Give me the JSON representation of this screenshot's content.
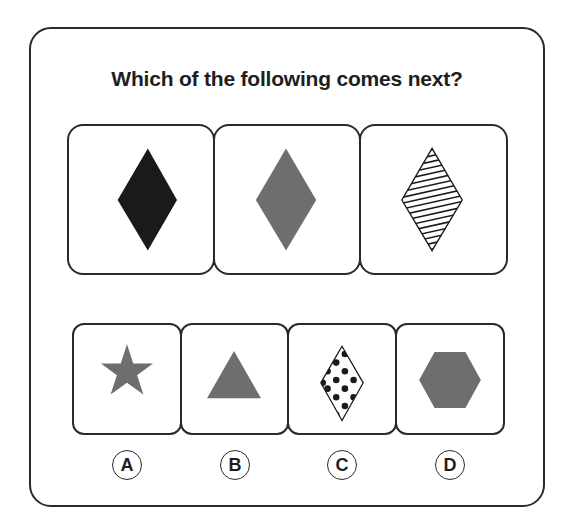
{
  "question": {
    "title": "Which of the following comes next?"
  },
  "sequence": [
    {
      "shape": "diamond",
      "fill": "solid",
      "color": "#1a1a1a"
    },
    {
      "shape": "diamond",
      "fill": "solid",
      "color": "#6e6e6e"
    },
    {
      "shape": "diamond",
      "fill": "hatched",
      "color": "#1a1a1a"
    }
  ],
  "options": [
    {
      "label": "A",
      "shape": "star",
      "fill": "solid",
      "color": "#6e6e6e"
    },
    {
      "label": "B",
      "shape": "triangle",
      "fill": "solid",
      "color": "#6e6e6e"
    },
    {
      "label": "C",
      "shape": "diamond",
      "fill": "dotted",
      "color": "#1a1a1a"
    },
    {
      "label": "D",
      "shape": "hexagon",
      "fill": "solid",
      "color": "#6e6e6e"
    }
  ],
  "colors": {
    "border": "#2a2a2a",
    "dark": "#1a1a1a",
    "gray": "#6e6e6e"
  }
}
